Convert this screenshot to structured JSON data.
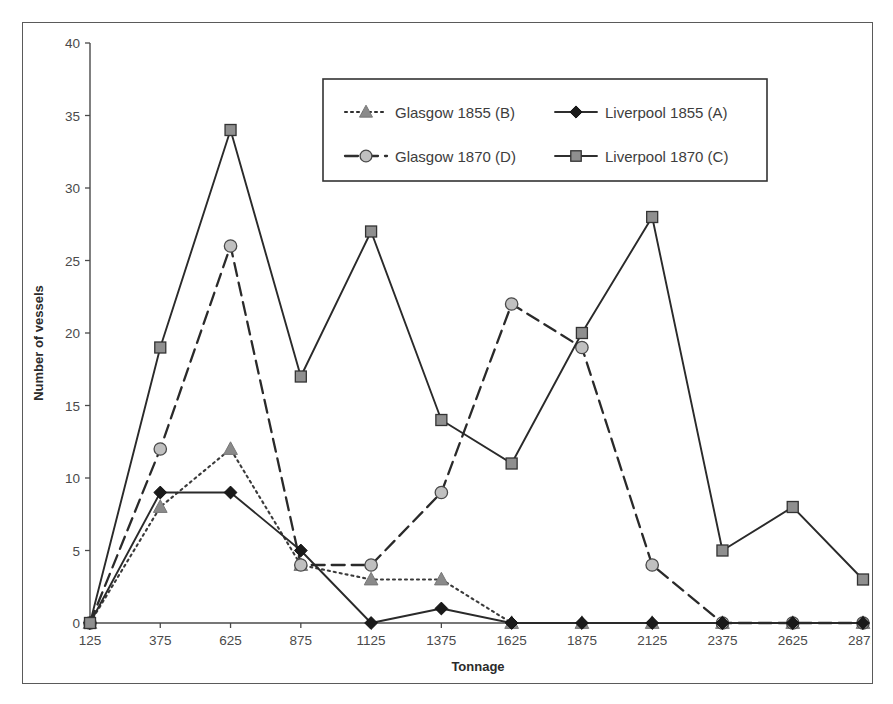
{
  "chart_data": {
    "type": "line",
    "title": "",
    "xlabel": "Tonnage",
    "ylabel": "Number of vessels",
    "categories": [
      125,
      375,
      625,
      875,
      1125,
      1375,
      1625,
      1875,
      2125,
      2375,
      2625,
      2875
    ],
    "xtick_labels": [
      "125",
      "375",
      "625",
      "875",
      "1125",
      "1375",
      "1625",
      "1875",
      "2125",
      "2375",
      "2625",
      "2875"
    ],
    "ytick_labels": [
      "0",
      "5",
      "10",
      "15",
      "20",
      "25",
      "30",
      "35",
      "40"
    ],
    "ylim": [
      0,
      40
    ],
    "ytick_step": 5,
    "grid": false,
    "legend_position": "top-center-inside",
    "series": [
      {
        "name": "Glasgow 1855 (B)",
        "code": "B",
        "marker": "triangle",
        "marker_color": "#8a8a8a",
        "line_style": "dotted",
        "line_color": "#3a3a3a",
        "values": [
          0,
          8,
          12,
          4,
          3,
          3,
          0,
          0,
          0,
          0,
          0,
          0
        ]
      },
      {
        "name": "Liverpool 1855 (A)",
        "code": "A",
        "marker": "diamond",
        "marker_color": "#1a1a1a",
        "line_style": "solid",
        "line_color": "#2a2a2a",
        "values": [
          0,
          9,
          9,
          5,
          0,
          1,
          0,
          0,
          0,
          0,
          0,
          0
        ]
      },
      {
        "name": "Glasgow 1870 (D)",
        "code": "D",
        "marker": "circle",
        "marker_color": "#c0c0c0",
        "line_style": "dashed",
        "line_color": "#2a2a2a",
        "values": [
          0,
          12,
          26,
          4,
          4,
          9,
          22,
          19,
          4,
          0,
          0,
          0
        ]
      },
      {
        "name": "Liverpool 1870 (C)",
        "code": "C",
        "marker": "square",
        "marker_color": "#8f8f8f",
        "line_style": "solid",
        "line_color": "#2a2a2a",
        "values": [
          0,
          19,
          34,
          17,
          27,
          14,
          11,
          20,
          28,
          5,
          8,
          3
        ]
      }
    ],
    "legend_entries": [
      {
        "label": "Glasgow 1855 (B)",
        "marker": "triangle",
        "line_style": "dotted"
      },
      {
        "label": "Liverpool 1855 (A)",
        "marker": "diamond",
        "line_style": "solid"
      },
      {
        "label": "Glasgow 1870 (D)",
        "marker": "circle",
        "line_style": "dashed"
      },
      {
        "label": "Liverpool 1870 (C)",
        "marker": "square",
        "line_style": "solid"
      }
    ],
    "colors": {
      "axis": "#4a4a4a",
      "text": "#3a3a3a",
      "frame": "#5a5a5a",
      "background": "#ffffff"
    }
  }
}
